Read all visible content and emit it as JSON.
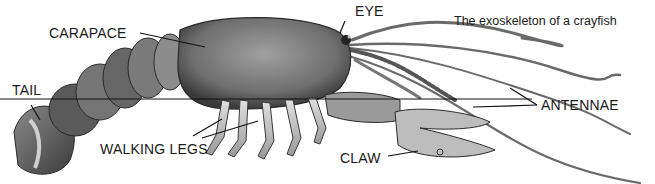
{
  "diagram": {
    "caption": "The exoskeleton of a crayfish",
    "subject": "crayfish",
    "labels": {
      "carapace": "CARAPACE",
      "eye": "EYE",
      "tail": "TAIL",
      "walking_legs": "WALKING LEGS",
      "antennae": "ANTENNAE",
      "claw": "CLAW"
    }
  }
}
